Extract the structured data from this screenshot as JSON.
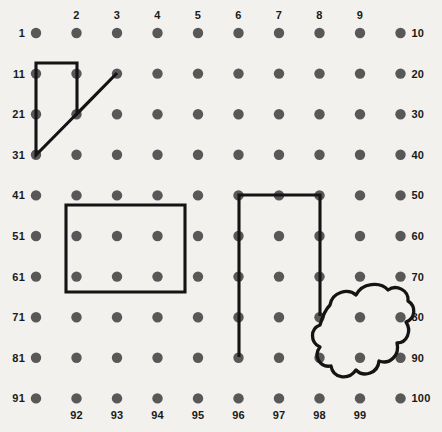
{
  "page": {
    "background_color": "#f2f1ee",
    "dot_color": "#585858",
    "line_color": "#141414"
  },
  "grid": {
    "columns": 10,
    "rows": 10,
    "origin_x": 36,
    "origin_y": 33,
    "spacing_x": 40.5,
    "spacing_y": 40.6,
    "dot_radius": 5.2
  },
  "labels": {
    "left": [
      "1",
      "11",
      "21",
      "31",
      "41",
      "51",
      "61",
      "71",
      "81",
      "91"
    ],
    "right": [
      "10",
      "20",
      "30",
      "40",
      "50",
      "60",
      "70",
      "80",
      "90",
      "100"
    ],
    "top": [
      "2",
      "3",
      "4",
      "5",
      "6",
      "7",
      "8",
      "9"
    ],
    "bottom": [
      "92",
      "93",
      "94",
      "95",
      "96",
      "97",
      "98",
      "99"
    ]
  },
  "chart_data": {
    "type": "scatter",
    "xlabel": "",
    "ylabel": "",
    "grid": true,
    "legend": "none",
    "columns": 10,
    "rows": 10,
    "row_start_labels": [
      1,
      11,
      21,
      31,
      41,
      51,
      61,
      71,
      81,
      91
    ],
    "row_end_labels": [
      10,
      20,
      30,
      40,
      50,
      60,
      70,
      80,
      90,
      100
    ],
    "column_labels_top": [
      2,
      3,
      4,
      5,
      6,
      7,
      8,
      9
    ],
    "column_labels_bottom": [
      92,
      93,
      94,
      95,
      96,
      97,
      98,
      99
    ],
    "shapes": [
      {
        "name": "quadrilateral-top-left",
        "kind": "polygon",
        "closed": true,
        "anchor_numbers": [
          11,
          12,
          22,
          13,
          31
        ],
        "points": "36,63 77,63 77,114 117,73 36,155"
      },
      {
        "name": "rectangle-middle-left",
        "kind": "rectangle",
        "closed": true,
        "anchor_numbers": [
          52,
          54,
          64,
          62
        ],
        "points": "66,205 185,205 185,292 66,292"
      },
      {
        "name": "u-shape-right",
        "kind": "polyline",
        "closed": false,
        "anchor_numbers": [
          86,
          46,
          48,
          78
        ],
        "points": "239,357 239,195 320,195 320,316"
      },
      {
        "name": "cloud-blob-bottom-right",
        "kind": "closed-curve",
        "closed": true,
        "anchor_numbers": [
          79,
          89,
          88,
          78
        ]
      }
    ]
  }
}
